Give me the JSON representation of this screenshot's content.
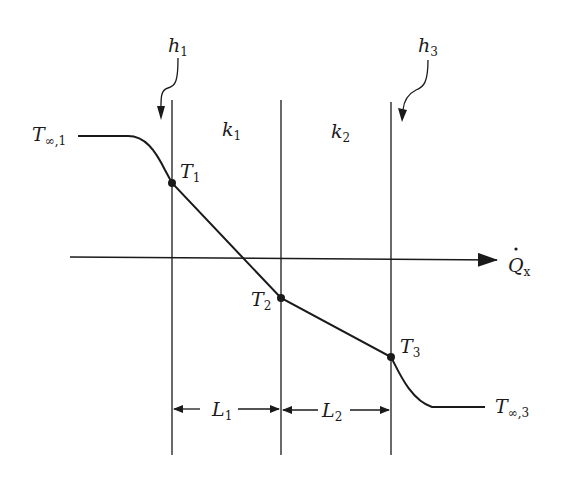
{
  "diagram": {
    "labels": {
      "h1": {
        "main": "h",
        "sub": "1"
      },
      "h3": {
        "main": "h",
        "sub": "3"
      },
      "k1": {
        "main": "k",
        "sub": "1"
      },
      "k2": {
        "main": "k",
        "sub": "2"
      },
      "T_inf1": {
        "main": "T",
        "sub": "∞,1"
      },
      "T_inf3": {
        "main": "T",
        "sub": "∞,3"
      },
      "T1": {
        "main": "T",
        "sub": "1"
      },
      "T2": {
        "main": "T",
        "sub": "2"
      },
      "T3": {
        "main": "T",
        "sub": "3"
      },
      "Q": {
        "main": "Q",
        "sub": "x"
      },
      "L1": {
        "main": "L",
        "sub": "1"
      },
      "L2": {
        "main": "L",
        "sub": "2"
      }
    },
    "colors": {
      "line": "#1a1a1a",
      "background": "#ffffff"
    }
  }
}
